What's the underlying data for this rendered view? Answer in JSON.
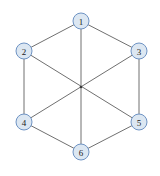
{
  "figure": {
    "background_color": "#ffffff",
    "width": 160,
    "height": 176
  },
  "style": {
    "node_fill": "#dce7f2",
    "node_stroke": "#6e93c4",
    "node_radius": 8,
    "node_label_color": "#1a1a1a",
    "edge_color": "#707070",
    "edge_width": 1,
    "center_dot_color": "#3a3a3a"
  },
  "chart_data": {
    "type": "diagram",
    "title": "",
    "xlabel": "",
    "ylabel": "",
    "grid": false,
    "legend": null,
    "graph_type": "undirected",
    "node_count": 6,
    "edge_count": 9,
    "nodes": [
      {
        "id": "n1",
        "label": "1",
        "x": 81,
        "y": 21
      },
      {
        "id": "n2",
        "label": "2",
        "x": 24,
        "y": 51
      },
      {
        "id": "n3",
        "label": "3",
        "x": 139,
        "y": 51
      },
      {
        "id": "n4",
        "label": "4",
        "x": 24,
        "y": 122
      },
      {
        "id": "n5",
        "label": "5",
        "x": 139,
        "y": 122
      },
      {
        "id": "n6",
        "label": "6",
        "x": 81,
        "y": 152
      }
    ],
    "edges": [
      {
        "id": "e1",
        "source": "n1",
        "target": "n2",
        "x1": 81,
        "y1": 21,
        "x2": 24,
        "y2": 51
      },
      {
        "id": "e2",
        "source": "n1",
        "target": "n3",
        "x1": 81,
        "y1": 21,
        "x2": 139,
        "y2": 51
      },
      {
        "id": "e3",
        "source": "n1",
        "target": "n6",
        "x1": 81,
        "y1": 21,
        "x2": 81,
        "y2": 152
      },
      {
        "id": "e4",
        "source": "n2",
        "target": "n4",
        "x1": 24,
        "y1": 51,
        "x2": 24,
        "y2": 122
      },
      {
        "id": "e5",
        "source": "n2",
        "target": "n5",
        "x1": 24,
        "y1": 51,
        "x2": 139,
        "y2": 122
      },
      {
        "id": "e6",
        "source": "n3",
        "target": "n5",
        "x1": 139,
        "y1": 51,
        "x2": 139,
        "y2": 122
      },
      {
        "id": "e7",
        "source": "n3",
        "target": "n4",
        "x1": 139,
        "y1": 51,
        "x2": 24,
        "y2": 122
      },
      {
        "id": "e8",
        "source": "n4",
        "target": "n6",
        "x1": 24,
        "y1": 122,
        "x2": 81,
        "y2": 152
      },
      {
        "id": "e9",
        "source": "n5",
        "target": "n6",
        "x1": 139,
        "y1": 122,
        "x2": 81,
        "y2": 152
      }
    ],
    "crossing_point": {
      "x": 81,
      "y": 87
    }
  }
}
